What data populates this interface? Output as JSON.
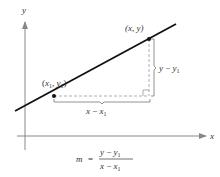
{
  "diagram": {
    "colors": {
      "line": "#111111",
      "axes": "#888888",
      "dashed": "#999999",
      "bracket": "#777777",
      "text": "#333333"
    },
    "axes": {
      "x_label": "x",
      "y_label": "y"
    },
    "points": [
      {
        "id": "p1",
        "label": "(x1, y1)",
        "label_parts": {
          "open": "(",
          "var1": "x",
          "sub1": "1",
          "sep": ", ",
          "var2": "y",
          "sub2": "1",
          "close": ")"
        }
      },
      {
        "id": "p2",
        "label": "(x, y)",
        "label_parts": {
          "text": "(x, y)"
        }
      }
    ],
    "rise": {
      "label": "y − y1",
      "var": "y",
      "op": " − ",
      "var1": "y",
      "sub": "1"
    },
    "run": {
      "label": "x − x1",
      "var": "x",
      "op": " − ",
      "var1": "x",
      "sub": "1"
    },
    "formula": {
      "lhs": "m",
      "eq": "=",
      "numerator": {
        "var": "y",
        "op": " − ",
        "var1": "y",
        "sub": "1"
      },
      "denominator": {
        "var": "x",
        "op": " − ",
        "var1": "x",
        "sub": "1"
      },
      "text": "m = (y − y1) / (x − x1)"
    }
  }
}
